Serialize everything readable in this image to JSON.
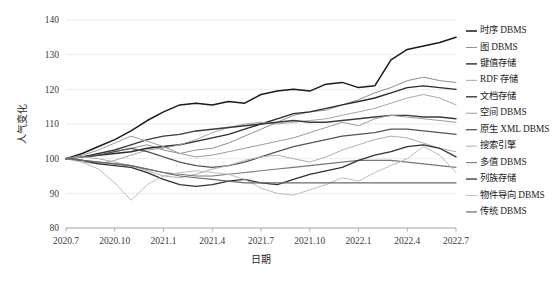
{
  "chart_data": {
    "type": "line",
    "title": "",
    "xlabel": "日期",
    "ylabel": "人气变化",
    "ylim": [
      80,
      140
    ],
    "yticks": [
      80,
      90,
      100,
      110,
      120,
      130,
      140
    ],
    "grid": true,
    "legend_position": "right",
    "categories": [
      "2020.7",
      "2020.8",
      "2020.9",
      "2020.10",
      "2020.11",
      "2020.12",
      "2021.1",
      "2021.2",
      "2021.3",
      "2021.4",
      "2021.5",
      "2021.6",
      "2021.7",
      "2021.8",
      "2021.9",
      "2021.10",
      "2021.11",
      "2021.12",
      "2022.1",
      "2022.2",
      "2022.3",
      "2022.4",
      "2022.5",
      "2022.6",
      "2022.7"
    ],
    "xticks": [
      "2020.7",
      "2020.10",
      "2021.1",
      "2021.4",
      "2021.7",
      "2021.10",
      "2022.1",
      "2022.4",
      "2022.7"
    ],
    "series": [
      {
        "name": "时序 DBMS",
        "color": "#1a1a1a",
        "width": 1.5,
        "values": [
          100,
          101.5,
          103.5,
          105.5,
          108,
          111,
          113.5,
          115.5,
          116,
          115.5,
          116.5,
          116,
          118.5,
          119.5,
          120,
          119.5,
          121.5,
          122,
          120.5,
          121,
          128.5,
          131.5,
          132.5,
          133.5,
          135
        ]
      },
      {
        "name": "图 DBMS",
        "color": "#8f8f8f",
        "width": 1.0,
        "values": [
          100,
          100.5,
          101,
          102,
          103,
          104,
          102.5,
          101.5,
          102.5,
          103,
          104.5,
          106.5,
          108.5,
          110.5,
          112.5,
          113.5,
          114,
          115.5,
          117,
          119,
          120.5,
          122.5,
          123.5,
          122.5,
          122
        ]
      },
      {
        "name": "键值存储",
        "color": "#2a2a2a",
        "width": 1.4,
        "values": [
          100,
          100.5,
          101,
          101.5,
          102,
          103,
          103.5,
          104,
          105,
          106,
          107,
          108.5,
          110,
          111.5,
          113,
          113.5,
          114.5,
          115.5,
          116.5,
          117.5,
          119,
          120.5,
          121,
          120.5,
          120
        ]
      },
      {
        "name": "RDF 存储",
        "color": "#a8a8a8",
        "width": 1.0,
        "values": [
          100,
          99,
          98.5,
          99.5,
          101,
          102.5,
          103,
          104,
          105.5,
          107.5,
          109,
          110,
          110.5,
          110,
          110.5,
          111,
          111.5,
          112.5,
          113.5,
          114.5,
          116,
          117.5,
          118.5,
          117.5,
          115.5
        ]
      },
      {
        "name": "文档存储",
        "color": "#3a3a3a",
        "width": 1.4,
        "values": [
          100,
          100.5,
          101.5,
          102.5,
          104,
          105.5,
          106.5,
          107,
          108,
          108.5,
          109,
          109.5,
          110,
          110.5,
          111,
          110.5,
          110.5,
          111,
          111.5,
          112,
          112.5,
          112.5,
          112,
          112,
          111.5
        ]
      },
      {
        "name": "空间 DBMS",
        "color": "#9c9c9c",
        "width": 1.0,
        "values": [
          100,
          101,
          102.5,
          104.5,
          106.5,
          105,
          103.5,
          101.5,
          100.5,
          101,
          102,
          103,
          104,
          105,
          106,
          107.5,
          109,
          110.5,
          109.5,
          111.5,
          112.5,
          112,
          111.5,
          111,
          110.5
        ]
      },
      {
        "name": "原生 XML DBMS",
        "color": "#555555",
        "width": 1.3,
        "values": [
          100,
          100.5,
          101,
          102,
          103,
          102,
          100.5,
          99,
          98,
          97.5,
          98,
          99,
          100.5,
          102,
          103.5,
          104.5,
          105.5,
          106.5,
          107,
          107.5,
          108.5,
          108.5,
          108,
          107.5,
          107
        ]
      },
      {
        "name": "搜索引擎",
        "color": "#b0b0b0",
        "width": 1.0,
        "values": [
          100,
          100.5,
          100,
          99,
          98,
          96.5,
          95,
          94.5,
          95.5,
          97,
          98,
          99.5,
          100.5,
          101,
          100,
          99,
          100.5,
          102.5,
          104,
          105.5,
          106.5,
          106,
          104.5,
          103,
          102
        ]
      },
      {
        "name": "多值 DBMS",
        "color": "#787878",
        "width": 1.1,
        "values": [
          100,
          99.5,
          99,
          98.5,
          98,
          97,
          96,
          95.5,
          95,
          95,
          95.5,
          96,
          96.5,
          97,
          97.5,
          98,
          98.5,
          99,
          99.5,
          99.5,
          99.5,
          99,
          98.5,
          98,
          97.5
        ]
      },
      {
        "name": "列族存储",
        "color": "#303030",
        "width": 1.3,
        "values": [
          100,
          99.5,
          98.5,
          98,
          97.5,
          96,
          94,
          92.5,
          92,
          92.5,
          93.5,
          94,
          93,
          92.5,
          94,
          95.5,
          96.5,
          97.5,
          99.5,
          101,
          102,
          103.5,
          104,
          103,
          100.5
        ]
      },
      {
        "name": "物件导向 DBMS",
        "color": "#bdbdbd",
        "width": 1.0,
        "values": [
          100,
          99,
          97,
          93,
          88,
          92.5,
          95,
          96,
          96.5,
          96,
          95.5,
          94,
          91.5,
          90,
          89.5,
          91,
          92.5,
          94.5,
          93.5,
          96,
          98,
          100,
          103.5,
          101,
          96
        ]
      },
      {
        "name": "传统 DBMS",
        "color": "#6a6a6a",
        "width": 1.2,
        "values": [
          100,
          99.5,
          99,
          98.5,
          98,
          97,
          96,
          95,
          94.5,
          94,
          93.5,
          93,
          93,
          93,
          93,
          93,
          93,
          93,
          93,
          93,
          93,
          93,
          93,
          93,
          93
        ]
      }
    ]
  }
}
